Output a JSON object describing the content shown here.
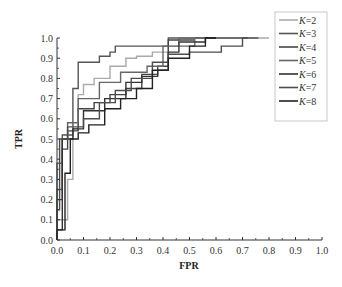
{
  "chart_data": {
    "type": "line",
    "title": "",
    "xlabel": "FPR",
    "ylabel": "TPR",
    "xlim": [
      0.0,
      1.0
    ],
    "ylim": [
      0.0,
      1.0
    ],
    "xticks": [
      "0.0",
      "0.1",
      "0.2",
      "0.3",
      "0.4",
      "0.5",
      "0.6",
      "0.7",
      "0.8",
      "0.9",
      "1.0"
    ],
    "yticks": [
      "0.0",
      "0.1",
      "0.2",
      "0.3",
      "0.4",
      "0.5",
      "0.6",
      "0.7",
      "0.8",
      "0.9",
      "1.0"
    ],
    "grid": false,
    "legend_position": "upper right",
    "series": [
      {
        "name": "K=2",
        "color": "#aaaaaa",
        "points": [
          [
            0,
            0
          ],
          [
            0,
            0.1
          ],
          [
            0.04,
            0.1
          ],
          [
            0.04,
            0.3
          ],
          [
            0.06,
            0.3
          ],
          [
            0.06,
            0.55
          ],
          [
            0.08,
            0.55
          ],
          [
            0.08,
            0.72
          ],
          [
            0.1,
            0.72
          ],
          [
            0.1,
            0.77
          ],
          [
            0.14,
            0.77
          ],
          [
            0.14,
            0.8
          ],
          [
            0.2,
            0.8
          ],
          [
            0.2,
            0.86
          ],
          [
            0.26,
            0.86
          ],
          [
            0.26,
            0.9
          ],
          [
            0.3,
            0.9
          ],
          [
            0.3,
            0.91
          ],
          [
            0.36,
            0.91
          ],
          [
            0.36,
            0.93
          ],
          [
            0.42,
            0.93
          ],
          [
            0.42,
            0.96
          ],
          [
            0.46,
            0.96
          ],
          [
            0.46,
            1.0
          ],
          [
            0.8,
            1.0
          ]
        ]
      },
      {
        "name": "K=3",
        "color": "#555555",
        "points": [
          [
            0,
            0
          ],
          [
            0,
            0.25
          ],
          [
            0.02,
            0.25
          ],
          [
            0.02,
            0.52
          ],
          [
            0.06,
            0.52
          ],
          [
            0.06,
            0.75
          ],
          [
            0.08,
            0.75
          ],
          [
            0.08,
            0.88
          ],
          [
            0.16,
            0.88
          ],
          [
            0.16,
            0.91
          ],
          [
            0.2,
            0.91
          ],
          [
            0.2,
            0.93
          ],
          [
            0.22,
            0.93
          ],
          [
            0.22,
            0.96
          ],
          [
            0.42,
            0.96
          ],
          [
            0.42,
            1.0
          ],
          [
            0.76,
            1.0
          ]
        ]
      },
      {
        "name": "K=4",
        "color": "#444444",
        "points": [
          [
            0,
            0
          ],
          [
            0,
            0.2
          ],
          [
            0.02,
            0.2
          ],
          [
            0.02,
            0.45
          ],
          [
            0.04,
            0.45
          ],
          [
            0.04,
            0.54
          ],
          [
            0.08,
            0.54
          ],
          [
            0.08,
            0.65
          ],
          [
            0.14,
            0.65
          ],
          [
            0.14,
            0.68
          ],
          [
            0.2,
            0.68
          ],
          [
            0.2,
            0.72
          ],
          [
            0.26,
            0.72
          ],
          [
            0.26,
            0.75
          ],
          [
            0.32,
            0.75
          ],
          [
            0.32,
            0.82
          ],
          [
            0.38,
            0.82
          ],
          [
            0.38,
            0.86
          ],
          [
            0.42,
            0.86
          ],
          [
            0.42,
            0.99
          ],
          [
            0.52,
            0.99
          ]
        ]
      },
      {
        "name": "K=5",
        "color": "#666666",
        "points": [
          [
            0,
            0
          ],
          [
            0,
            0.38
          ],
          [
            0.02,
            0.38
          ],
          [
            0.02,
            0.5
          ],
          [
            0.04,
            0.5
          ],
          [
            0.04,
            0.58
          ],
          [
            0.08,
            0.58
          ],
          [
            0.08,
            0.7
          ],
          [
            0.16,
            0.7
          ],
          [
            0.16,
            0.78
          ],
          [
            0.24,
            0.78
          ],
          [
            0.24,
            0.83
          ],
          [
            0.34,
            0.83
          ],
          [
            0.34,
            0.86
          ],
          [
            0.4,
            0.86
          ],
          [
            0.4,
            0.96
          ],
          [
            0.52,
            0.96
          ],
          [
            0.52,
            1.0
          ],
          [
            0.6,
            1.0
          ]
        ]
      },
      {
        "name": "K=6",
        "color": "#333333",
        "points": [
          [
            0,
            0
          ],
          [
            0,
            0.05
          ],
          [
            0.02,
            0.05
          ],
          [
            0.02,
            0.5
          ],
          [
            0.06,
            0.5
          ],
          [
            0.06,
            0.55
          ],
          [
            0.1,
            0.55
          ],
          [
            0.1,
            0.64
          ],
          [
            0.18,
            0.64
          ],
          [
            0.18,
            0.7
          ],
          [
            0.26,
            0.7
          ],
          [
            0.26,
            0.78
          ],
          [
            0.32,
            0.78
          ],
          [
            0.32,
            0.81
          ],
          [
            0.38,
            0.81
          ],
          [
            0.38,
            0.84
          ],
          [
            0.42,
            0.84
          ],
          [
            0.42,
            0.93
          ],
          [
            0.46,
            0.93
          ],
          [
            0.46,
            0.98
          ],
          [
            0.56,
            0.98
          ],
          [
            0.56,
            1.0
          ],
          [
            0.6,
            1.0
          ]
        ]
      },
      {
        "name": "K=7",
        "color": "#4d4d4d",
        "points": [
          [
            0,
            0
          ],
          [
            0,
            0.15
          ],
          [
            0.01,
            0.15
          ],
          [
            0.01,
            0.5
          ],
          [
            0.04,
            0.5
          ],
          [
            0.04,
            0.56
          ],
          [
            0.1,
            0.56
          ],
          [
            0.1,
            0.6
          ],
          [
            0.16,
            0.6
          ],
          [
            0.16,
            0.68
          ],
          [
            0.22,
            0.68
          ],
          [
            0.22,
            0.74
          ],
          [
            0.28,
            0.74
          ],
          [
            0.28,
            0.8
          ],
          [
            0.36,
            0.8
          ],
          [
            0.36,
            0.88
          ],
          [
            0.42,
            0.88
          ],
          [
            0.42,
            0.92
          ],
          [
            0.5,
            0.92
          ],
          [
            0.5,
            0.93
          ],
          [
            0.62,
            0.93
          ],
          [
            0.62,
            0.96
          ],
          [
            0.7,
            0.96
          ],
          [
            0.7,
            1.0
          ],
          [
            0.72,
            1.0
          ]
        ]
      },
      {
        "name": "K=8",
        "color": "#222222",
        "points": [
          [
            0,
            0
          ],
          [
            0,
            0.05
          ],
          [
            0.03,
            0.05
          ],
          [
            0.03,
            0.33
          ],
          [
            0.05,
            0.33
          ],
          [
            0.05,
            0.5
          ],
          [
            0.08,
            0.5
          ],
          [
            0.08,
            0.53
          ],
          [
            0.12,
            0.53
          ],
          [
            0.12,
            0.57
          ],
          [
            0.18,
            0.57
          ],
          [
            0.18,
            0.65
          ],
          [
            0.24,
            0.65
          ],
          [
            0.24,
            0.7
          ],
          [
            0.3,
            0.7
          ],
          [
            0.3,
            0.75
          ],
          [
            0.36,
            0.75
          ],
          [
            0.36,
            0.84
          ],
          [
            0.42,
            0.84
          ],
          [
            0.42,
            0.9
          ],
          [
            0.5,
            0.9
          ],
          [
            0.5,
            0.96
          ],
          [
            0.56,
            0.96
          ],
          [
            0.56,
            1.0
          ],
          [
            0.6,
            1.0
          ]
        ]
      }
    ]
  }
}
